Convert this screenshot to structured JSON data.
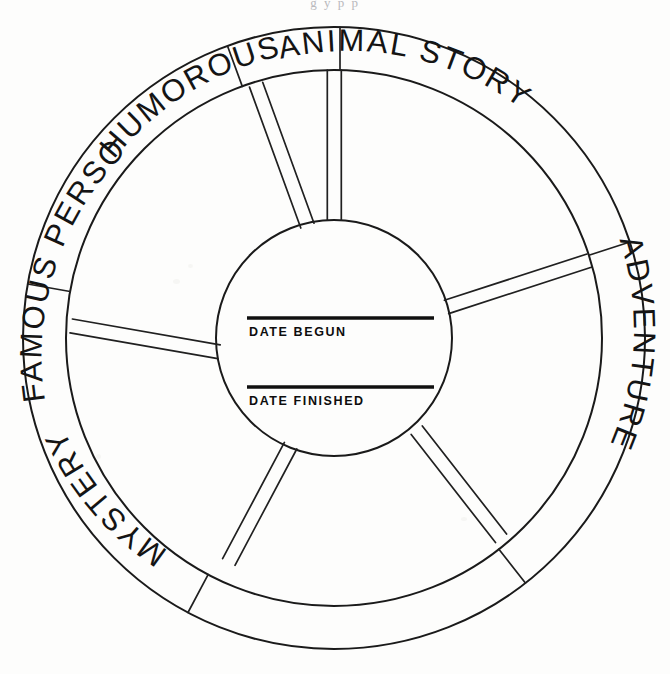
{
  "page": {
    "kind": "worksheet",
    "background_color": "#fdfdfc",
    "ink_color": "#1a1a1a",
    "scan_artifact_top": "g y p p"
  },
  "wheel": {
    "name": "reading-record-wheel",
    "outer_radius": 310,
    "ring_inner_radius": 268,
    "hub_radius": 118,
    "center": {
      "x": 334,
      "y": 338
    },
    "segment_count": 6,
    "segments": [
      {
        "id": "animal-story",
        "label": "ANIMAL STORY",
        "start_deg": -90,
        "end_deg": -18
      },
      {
        "id": "adventure",
        "label": "ADVENTURE",
        "start_deg": -18,
        "end_deg": 52
      },
      {
        "id": "unlabeled-se",
        "label": "",
        "start_deg": 52,
        "end_deg": 118
      },
      {
        "id": "mystery",
        "label": "MYSTERY",
        "start_deg": 118,
        "end_deg": 190
      },
      {
        "id": "famous-person",
        "label": "FAMOUS PERSON",
        "start_deg": 190,
        "end_deg": 250
      },
      {
        "id": "humorous",
        "label": "HUMOROUS",
        "start_deg": 250,
        "end_deg": -90
      }
    ],
    "spoke_angles_deg": [
      -90,
      -18,
      52,
      118,
      190,
      250
    ],
    "spoke_half_width_px": 7
  },
  "hub": {
    "fields": [
      {
        "id": "date-begun",
        "label": "DATE BEGUN",
        "value": "",
        "line_y": 318,
        "line_x1": 247,
        "line_x2": 434
      },
      {
        "id": "date-finished",
        "label": "DATE FINISHED",
        "value": "",
        "line_y": 387,
        "line_x1": 247,
        "line_x2": 434
      }
    ]
  }
}
